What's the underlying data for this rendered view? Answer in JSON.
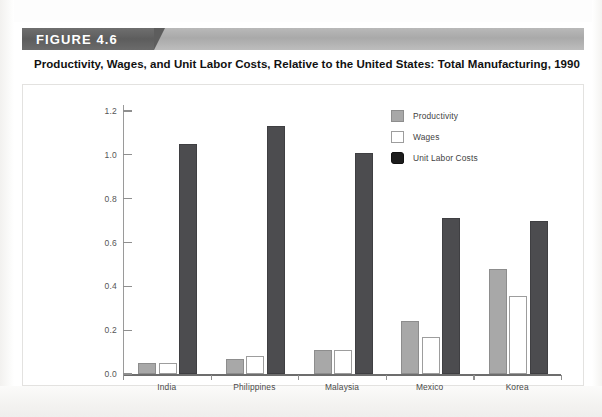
{
  "figure": {
    "label": "FIGURE 4.6",
    "title": "Productivity, Wages, and Unit Labor Costs, Relative to the United States: Total Manufacturing, 1990"
  },
  "colors": {
    "productivity": "#a8a8a8",
    "wages": "#ffffff",
    "unit_labor_costs": "#4c4c4f",
    "banner_tab": "#5d5d5d",
    "banner_bar": "#b2b2b2",
    "axis": "#8f8f8f"
  },
  "chart_data": {
    "type": "bar",
    "title": "Productivity, Wages, and Unit Labor Costs, Relative to the United States: Total Manufacturing, 1990",
    "xlabel": "",
    "ylabel": "",
    "categories": [
      "India",
      "Philippines",
      "Malaysia",
      "Mexico",
      "Korea"
    ],
    "series": [
      {
        "name": "Productivity",
        "values": [
          0.05,
          0.07,
          0.11,
          0.24,
          0.48
        ]
      },
      {
        "name": "Wages",
        "values": [
          0.05,
          0.08,
          0.11,
          0.17,
          0.355
        ]
      },
      {
        "name": "Unit Labor Costs",
        "values": [
          1.05,
          1.13,
          1.01,
          0.71,
          0.7
        ]
      }
    ],
    "ylim": [
      0.0,
      1.2
    ],
    "yticks": [
      "0.0",
      "0.2",
      "0.4",
      "0.6",
      "0.8",
      "1.0",
      "1.2"
    ],
    "ytick_values": [
      0.0,
      0.2,
      0.4,
      0.6,
      0.8,
      1.0,
      1.2
    ],
    "grid": false,
    "legend_position": "upper right",
    "legend": [
      "Productivity",
      "Wages",
      "Unit Labor Costs"
    ]
  }
}
